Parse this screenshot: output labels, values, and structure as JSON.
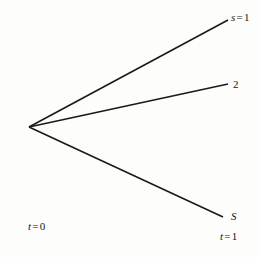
{
  "figure": {
    "type": "branching-fan-diagram",
    "background_color": "#fdfdfc",
    "line_color": "#1a1a1a",
    "text_color": "#141414",
    "origin": {
      "x": 29,
      "y": 127,
      "label": "t = 0"
    },
    "labels": {
      "state_top": {
        "var": "s",
        "eq": "=",
        "value": "1",
        "full": "s = 1"
      },
      "state_middle": {
        "value": "2",
        "full": "2"
      },
      "state_bottom": {
        "var": "S",
        "full": "S"
      },
      "time_start": {
        "var": "t",
        "eq": "=",
        "value": "0",
        "full": "t = 0"
      },
      "time_end": {
        "var": "t",
        "eq": "=",
        "value": "1",
        "full": "t = 1"
      }
    },
    "branches": [
      {
        "name": "branch-s-1",
        "x1": 29,
        "y1": 127,
        "x2": 228,
        "y2": 20,
        "end_label": "s = 1"
      },
      {
        "name": "branch-s-2",
        "x1": 29,
        "y1": 127,
        "x2": 228,
        "y2": 84,
        "end_label": "2"
      },
      {
        "name": "branch-s-S",
        "x1": 29,
        "y1": 127,
        "x2": 223,
        "y2": 217,
        "end_label": "S"
      }
    ]
  }
}
